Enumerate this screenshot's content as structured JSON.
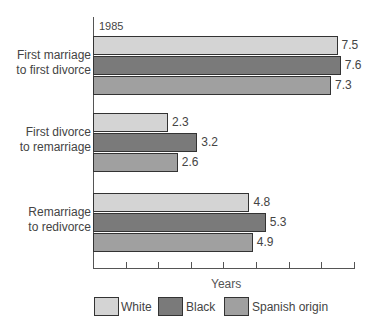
{
  "chart_data": {
    "type": "bar",
    "orientation": "horizontal",
    "title": "1985",
    "xlabel": "Years",
    "ylabel": "",
    "categories": [
      "First marriage to first divorce",
      "First divorce to remarriage",
      "Remarriage to redivorce"
    ],
    "category_lines": [
      [
        "First marriage",
        "to first divorce"
      ],
      [
        "First divorce",
        "to remarriage"
      ],
      [
        "Remarriage",
        "to redivorce"
      ]
    ],
    "series": [
      {
        "name": "White",
        "color": "#d4d4d4",
        "values": [
          7.5,
          2.3,
          4.8
        ]
      },
      {
        "name": "Black",
        "color": "#7a7a7a",
        "values": [
          7.6,
          3.2,
          5.3
        ]
      },
      {
        "name": "Spanish origin",
        "color": "#a0a0a0",
        "values": [
          7.3,
          2.6,
          4.9
        ]
      }
    ],
    "xlim": [
      0,
      8
    ],
    "x_ticks": [
      0,
      1,
      2,
      3,
      4,
      5,
      6,
      7,
      8
    ],
    "tick_labels_shown": false,
    "grid": false,
    "legend_position": "bottom"
  }
}
